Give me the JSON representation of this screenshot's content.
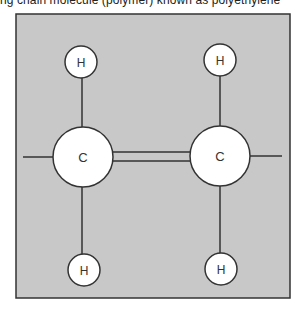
{
  "caption": "ng chain molecule (polymer) known as polyethylene",
  "diagram": {
    "colors": {
      "background": "#c8c8c8",
      "atom_fill": "#ffffff",
      "stroke": "#333333"
    },
    "atoms": [
      {
        "id": "C1",
        "label": "C",
        "cx": 83,
        "cy": 157,
        "r": 30
      },
      {
        "id": "C2",
        "label": "C",
        "cx": 220,
        "cy": 156,
        "r": 30
      },
      {
        "id": "H1",
        "label": "H",
        "cx": 81,
        "cy": 62,
        "r": 16
      },
      {
        "id": "H2",
        "label": "H",
        "cx": 220,
        "cy": 60,
        "r": 16
      },
      {
        "id": "H3",
        "label": "H",
        "cx": 84,
        "cy": 270,
        "r": 16
      },
      {
        "id": "H4",
        "label": "H",
        "cx": 221,
        "cy": 269,
        "r": 16
      }
    ],
    "bonds": [
      {
        "from": "C1",
        "to": "C2",
        "type": "double"
      },
      {
        "from": "C1",
        "to": "H1",
        "type": "single"
      },
      {
        "from": "C1",
        "to": "H3",
        "type": "single"
      },
      {
        "from": "C2",
        "to": "H2",
        "type": "single"
      },
      {
        "from": "C2",
        "to": "H4",
        "type": "single"
      },
      {
        "from": "C1",
        "to": "chain-left",
        "type": "single"
      },
      {
        "from": "C2",
        "to": "chain-right",
        "type": "single"
      }
    ]
  }
}
